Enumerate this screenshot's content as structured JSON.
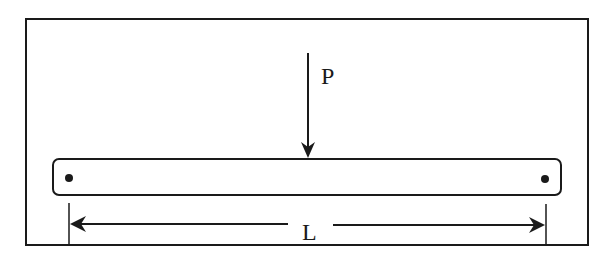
{
  "diagram": {
    "type": "simply-supported beam with central point load",
    "load_label": "P",
    "length_label": "L",
    "colors": {
      "stroke": "#1a1a1a",
      "background": "#ffffff"
    }
  }
}
